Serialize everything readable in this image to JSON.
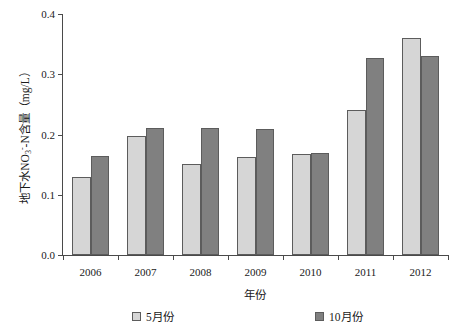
{
  "chart_data": {
    "type": "bar",
    "title": "",
    "xlabel": "年份",
    "ylabel": "地下水NO3--N含量（mg/L）",
    "categories": [
      "2006",
      "2007",
      "2008",
      "2009",
      "2010",
      "2011",
      "2012"
    ],
    "series": [
      {
        "name": "5月份",
        "color": "#d6d6d6",
        "values": [
          0.13,
          0.198,
          0.151,
          0.162,
          0.167,
          0.24,
          0.36
        ]
      },
      {
        "name": "10月份",
        "color": "#808080",
        "values": [
          0.164,
          0.21,
          0.21,
          0.209,
          0.17,
          0.327,
          0.33
        ]
      }
    ],
    "ylim": [
      0.0,
      0.4
    ],
    "yticks": [
      "0.0",
      "0.1",
      "0.2",
      "0.3",
      "0.4"
    ],
    "ytick_values": [
      0.0,
      0.1,
      0.2,
      0.3,
      0.4
    ],
    "grid": false,
    "legend_position": "bottom"
  },
  "axis": {
    "y_title_prefix": "地下水NO",
    "y_title_sub": "3",
    "y_title_sup": "-",
    "y_title_suffix": "-N含量（mg/L）",
    "x_title": "年份"
  },
  "legend": {
    "entries": [
      {
        "label": "5月份"
      },
      {
        "label": "10月份"
      }
    ]
  }
}
